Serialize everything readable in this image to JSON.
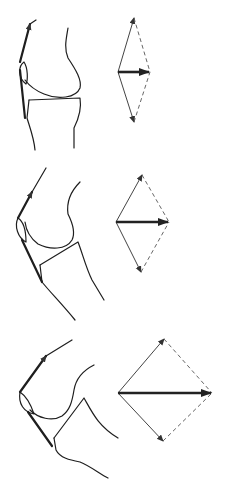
{
  "diagram": {
    "panels": [
      {
        "id": "extension",
        "knee_flexion": "near full extension",
        "resultant_magnitude": "small"
      },
      {
        "id": "mid-flexion",
        "knee_flexion": "moderate flexion",
        "resultant_magnitude": "medium"
      },
      {
        "id": "deep-flexion",
        "knee_flexion": "deep flexion",
        "resultant_magnitude": "large"
      }
    ],
    "legend": {
      "solid_thin_arrows": "component forces (quadriceps & patellar tendon)",
      "dashed_lines": "parallelogram construction",
      "thick_arrow": "resultant force"
    },
    "colors": {
      "line": "#1e1e1e",
      "background": "#ffffff"
    }
  }
}
